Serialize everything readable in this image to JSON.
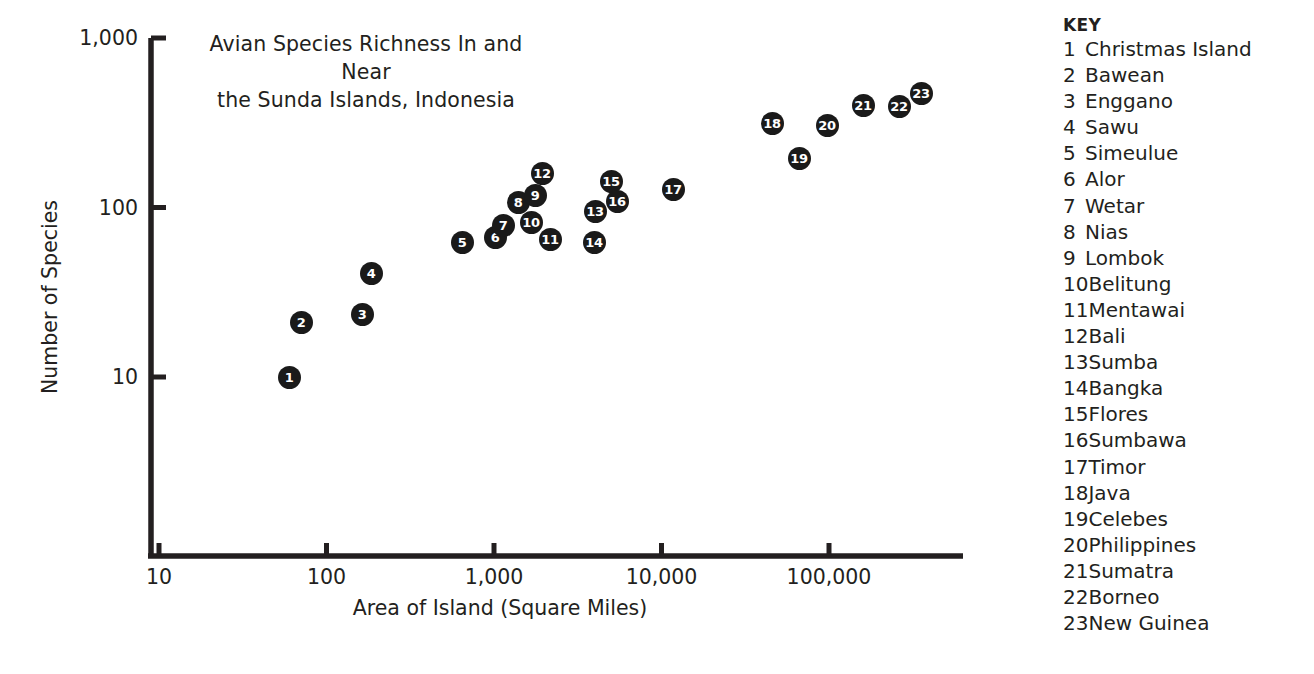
{
  "chart_data": {
    "type": "scatter",
    "title": "Avian Species Richness In and Near the Sunda Islands, Indonesia",
    "title_line1": "Avian Species Richness In and Near",
    "title_line2": "the Sunda Islands, Indonesia",
    "xlabel": "Area of Island (Square Miles)",
    "ylabel": "Number of Species",
    "xscale": "log",
    "yscale": "log",
    "xlim": [
      10,
      1000000
    ],
    "ylim": [
      10,
      1000
    ],
    "grid": false,
    "legend_position": "right",
    "xticks": [
      {
        "value": 10,
        "label": "10"
      },
      {
        "value": 100,
        "label": "100"
      },
      {
        "value": 1000,
        "label": "1,000"
      },
      {
        "value": 10000,
        "label": "10,000"
      },
      {
        "value": 100000,
        "label": "100,000"
      }
    ],
    "yticks": [
      {
        "value": 10,
        "label": "10"
      },
      {
        "value": 100,
        "label": "100"
      },
      {
        "value": 1000,
        "label": "1,000"
      }
    ],
    "point_color": "#1a1a1a",
    "point_label_color": "#ffffff",
    "points": [
      {
        "id": 1,
        "label": "1",
        "name": "Christmas Island",
        "area": 62,
        "species": 11,
        "px": 289,
        "py": 377
      },
      {
        "id": 2,
        "label": "2",
        "name": "Bawean",
        "area": 75,
        "species": 22,
        "px": 301,
        "py": 322
      },
      {
        "id": 3,
        "label": "3",
        "name": "Enggano",
        "area": 170,
        "species": 25,
        "px": 362,
        "py": 314
      },
      {
        "id": 4,
        "label": "4",
        "name": "Sawu",
        "area": 200,
        "species": 42,
        "px": 371,
        "py": 273
      },
      {
        "id": 5,
        "label": "5",
        "name": "Simeulue",
        "area": 650,
        "species": 67,
        "px": 462,
        "py": 242
      },
      {
        "id": 6,
        "label": "6",
        "name": "Alor",
        "area": 1000,
        "species": 76,
        "px": 495,
        "py": 237
      },
      {
        "id": 7,
        "label": "7",
        "name": "Wetar",
        "area": 1100,
        "species": 86,
        "px": 503,
        "py": 225
      },
      {
        "id": 8,
        "label": "8",
        "name": "Nias",
        "area": 1400,
        "species": 108,
        "px": 518,
        "py": 202
      },
      {
        "id": 9,
        "label": "9",
        "name": "Lombok",
        "area": 1700,
        "species": 118,
        "px": 535,
        "py": 195
      },
      {
        "id": 10,
        "label": "10",
        "name": "Belitung",
        "area": 1600,
        "species": 88,
        "px": 531,
        "py": 222
      },
      {
        "id": 11,
        "label": "11",
        "name": "Mentawai",
        "area": 2200,
        "species": 70,
        "px": 550,
        "py": 239
      },
      {
        "id": 12,
        "label": "12",
        "name": "Bali",
        "area": 2000,
        "species": 160,
        "px": 542,
        "py": 173
      },
      {
        "id": 13,
        "label": "13",
        "name": "Sumba",
        "area": 4200,
        "species": 100,
        "px": 595,
        "py": 211
      },
      {
        "id": 14,
        "label": "14",
        "name": "Bangka",
        "area": 4100,
        "species": 67,
        "px": 594,
        "py": 242
      },
      {
        "id": 15,
        "label": "15",
        "name": "Flores",
        "area": 5500,
        "species": 145,
        "px": 611,
        "py": 181
      },
      {
        "id": 16,
        "label": "16",
        "name": "Sumbawa",
        "area": 5900,
        "species": 110,
        "px": 617,
        "py": 201
      },
      {
        "id": 17,
        "label": "17",
        "name": "Timor",
        "area": 13000,
        "species": 125,
        "px": 673,
        "py": 189
      },
      {
        "id": 18,
        "label": "18",
        "name": "Java",
        "area": 51000,
        "species": 300,
        "px": 772,
        "py": 123
      },
      {
        "id": 19,
        "label": "19",
        "name": "Celebes",
        "area": 69000,
        "species": 190,
        "px": 799,
        "py": 158
      },
      {
        "id": 20,
        "label": "20",
        "name": "Philippines",
        "area": 100000,
        "species": 290,
        "px": 827,
        "py": 125
      },
      {
        "id": 21,
        "label": "21",
        "name": "Sumatra",
        "area": 165000,
        "species": 400,
        "px": 863,
        "py": 105
      },
      {
        "id": 22,
        "label": "22",
        "name": "Borneo",
        "area": 285000,
        "species": 395,
        "px": 899,
        "py": 106
      },
      {
        "id": 23,
        "label": "23",
        "name": "New Guinea",
        "area": 330000,
        "species": 480,
        "px": 921,
        "py": 93
      }
    ]
  },
  "key": {
    "heading": "KEY",
    "items": [
      {
        "num": "1",
        "name": "Christmas Island"
      },
      {
        "num": "2",
        "name": "Bawean"
      },
      {
        "num": "3",
        "name": "Enggano"
      },
      {
        "num": "4",
        "name": "Sawu"
      },
      {
        "num": "5",
        "name": "Simeulue"
      },
      {
        "num": "6",
        "name": "Alor"
      },
      {
        "num": "7",
        "name": "Wetar"
      },
      {
        "num": "8",
        "name": "Nias"
      },
      {
        "num": "9",
        "name": "Lombok"
      },
      {
        "num": "10",
        "name": "Belitung"
      },
      {
        "num": "11",
        "name": "Mentawai"
      },
      {
        "num": "12",
        "name": "Bali"
      },
      {
        "num": "13",
        "name": "Sumba"
      },
      {
        "num": "14",
        "name": "Bangka"
      },
      {
        "num": "15",
        "name": "Flores"
      },
      {
        "num": "16",
        "name": "Sumbawa"
      },
      {
        "num": "17",
        "name": "Timor"
      },
      {
        "num": "18",
        "name": "Java"
      },
      {
        "num": "19",
        "name": "Celebes"
      },
      {
        "num": "20",
        "name": "Philippines"
      },
      {
        "num": "21",
        "name": "Sumatra"
      },
      {
        "num": "22",
        "name": "Borneo"
      },
      {
        "num": "23",
        "name": "New Guinea"
      }
    ]
  },
  "geometry": {
    "x_origin_px": 159,
    "y_origin_px": 377,
    "x_decade_px": 167.5,
    "y_decade_px": 169.5,
    "axis_right_px": 963,
    "axis_bottom_px": 556,
    "axis_top_px": 38
  }
}
